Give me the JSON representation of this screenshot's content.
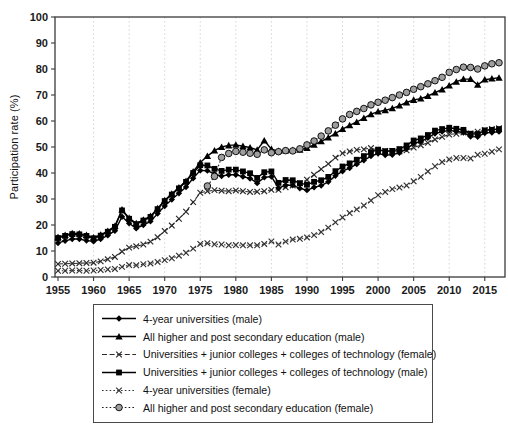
{
  "chart_data": {
    "type": "line",
    "title": "",
    "xlabel": "",
    "ylabel": "Participation rate (%)",
    "xlim": [
      1955,
      2018
    ],
    "ylim": [
      0,
      100
    ],
    "yticks": [
      0,
      10,
      20,
      30,
      40,
      50,
      60,
      70,
      80,
      90,
      100
    ],
    "xticks": [
      1955,
      1960,
      1965,
      1970,
      1975,
      1980,
      1985,
      1990,
      1995,
      2000,
      2005,
      2010,
      2015
    ],
    "grid": "vertical-dotted",
    "legend_position": "bottom-outside",
    "x": [
      1955,
      1956,
      1957,
      1958,
      1959,
      1960,
      1961,
      1962,
      1963,
      1964,
      1965,
      1966,
      1967,
      1968,
      1969,
      1970,
      1971,
      1972,
      1973,
      1974,
      1975,
      1976,
      1977,
      1978,
      1979,
      1980,
      1981,
      1982,
      1983,
      1984,
      1985,
      1986,
      1987,
      1988,
      1989,
      1990,
      1991,
      1992,
      1993,
      1994,
      1995,
      1996,
      1997,
      1998,
      1999,
      2000,
      2001,
      2002,
      2003,
      2004,
      2005,
      2006,
      2007,
      2008,
      2009,
      2010,
      2011,
      2012,
      2013,
      2014,
      2015,
      2016,
      2017
    ],
    "series": [
      {
        "name": "4-year universities (male)",
        "marker": "diamond",
        "line": "solid",
        "color": "#000000",
        "values": [
          13.1,
          13.9,
          14.6,
          14.6,
          14.0,
          13.7,
          14.6,
          16.0,
          17.8,
          23.2,
          20.7,
          18.7,
          20.0,
          21.4,
          24.4,
          27.3,
          29.8,
          32.2,
          34.6,
          38.0,
          41.0,
          40.9,
          39.6,
          38.8,
          39.3,
          39.3,
          38.6,
          37.9,
          36.1,
          38.3,
          38.6,
          34.2,
          35.3,
          35.3,
          34.1,
          33.4,
          34.5,
          35.2,
          36.6,
          38.9,
          40.7,
          41.9,
          43.4,
          44.9,
          46.5,
          47.5,
          46.9,
          47.0,
          47.8,
          49.3,
          51.3,
          52.1,
          53.5,
          55.2,
          55.9,
          56.4,
          56.0,
          55.6,
          54.0,
          53.9,
          55.4,
          55.6,
          55.9
        ]
      },
      {
        "name": "All higher and post secondary education (male)",
        "marker": "triangle",
        "line": "solid",
        "color": "#000000",
        "values": [
          15.3,
          16.1,
          16.8,
          16.7,
          16.1,
          15.2,
          16.2,
          17.7,
          19.6,
          25.9,
          22.7,
          20.6,
          22.0,
          23.4,
          26.4,
          29.5,
          32.0,
          34.4,
          36.9,
          40.5,
          44.0,
          46.5,
          48.6,
          50.0,
          50.6,
          50.8,
          50.3,
          49.8,
          48.9,
          52.5,
          49.2,
          48.4,
          48.6,
          48.8,
          48.9,
          49.6,
          50.8,
          52.2,
          53.6,
          55.2,
          56.9,
          58.3,
          59.6,
          61.1,
          62.6,
          63.6,
          64.1,
          64.9,
          65.9,
          67.1,
          68.1,
          68.6,
          69.6,
          70.9,
          72.1,
          73.6,
          75.1,
          76.1,
          76.1,
          73.9,
          75.9,
          76.3,
          76.6
        ]
      },
      {
        "name": "Universities + junior colleges + colleges of technology (female)",
        "marker": "x",
        "line": "dashed",
        "color": "#2a2a2a",
        "values": [
          5.0,
          5.1,
          5.2,
          5.3,
          5.4,
          5.5,
          6.0,
          6.8,
          7.7,
          9.8,
          11.3,
          11.8,
          12.5,
          13.6,
          15.3,
          17.7,
          19.8,
          22.4,
          25.1,
          28.8,
          32.4,
          33.0,
          33.4,
          33.2,
          33.0,
          33.3,
          33.0,
          32.7,
          32.8,
          33.0,
          33.5,
          33.5,
          34.5,
          35.2,
          36.0,
          37.4,
          39.3,
          41.5,
          43.5,
          45.9,
          47.6,
          48.3,
          48.9,
          49.1,
          49.6,
          48.7,
          48.5,
          48.5,
          48.3,
          48.7,
          49.8,
          50.7,
          51.6,
          52.9,
          53.9,
          54.8,
          55.1,
          55.6,
          55.2,
          55.9,
          56.5,
          56.9,
          57.2
        ]
      },
      {
        "name": "Universities + junior colleges + colleges of technology (male)",
        "marker": "square",
        "line": "solid",
        "color": "#000000",
        "values": [
          15.0,
          15.8,
          16.5,
          16.4,
          15.8,
          14.9,
          15.9,
          17.4,
          19.3,
          25.6,
          22.4,
          20.3,
          21.7,
          23.1,
          26.1,
          29.2,
          31.7,
          34.1,
          36.6,
          40.0,
          43.0,
          42.9,
          41.6,
          40.8,
          41.3,
          41.3,
          40.6,
          39.9,
          38.1,
          40.3,
          40.6,
          36.2,
          37.3,
          37.2,
          36.1,
          35.5,
          36.6,
          37.2,
          38.5,
          40.7,
          42.5,
          43.7,
          45.1,
          46.5,
          48.0,
          49.0,
          48.4,
          48.5,
          49.2,
          50.6,
          52.5,
          53.3,
          54.6,
          56.3,
          56.9,
          57.4,
          57.0,
          56.6,
          55.1,
          55.0,
          56.4,
          56.6,
          56.9
        ]
      },
      {
        "name": "4-year universities (female)",
        "marker": "x",
        "line": "dotted",
        "color": "#333333",
        "values": [
          2.4,
          2.4,
          2.5,
          2.5,
          2.4,
          2.5,
          2.7,
          2.9,
          3.1,
          3.9,
          4.6,
          4.5,
          4.9,
          5.2,
          5.8,
          6.5,
          7.2,
          8.2,
          9.3,
          10.9,
          12.7,
          13.0,
          12.6,
          12.5,
          12.2,
          12.3,
          12.2,
          12.2,
          12.2,
          12.7,
          13.7,
          12.5,
          13.6,
          14.4,
          14.7,
          15.2,
          16.1,
          17.3,
          19.0,
          21.0,
          22.9,
          24.6,
          26.0,
          27.5,
          29.4,
          31.5,
          32.7,
          33.8,
          34.4,
          35.2,
          36.8,
          38.5,
          40.6,
          42.6,
          44.2,
          45.2,
          45.8,
          45.8,
          45.6,
          47.0,
          47.4,
          48.2,
          49.1
        ]
      },
      {
        "name": "All higher and post secondary education (female)",
        "marker": "circle",
        "line": "dotted",
        "color": "#1a1a1a",
        "marker_fill": "#9e9e9e",
        "values": [
          null,
          null,
          null,
          null,
          null,
          null,
          null,
          null,
          null,
          null,
          null,
          null,
          null,
          null,
          null,
          null,
          null,
          null,
          null,
          null,
          null,
          35.0,
          38.7,
          46.0,
          47.5,
          48.3,
          48.0,
          47.6,
          47.2,
          48.9,
          47.8,
          48.2,
          48.6,
          48.5,
          49.3,
          50.8,
          52.3,
          54.2,
          56.2,
          58.4,
          60.8,
          62.5,
          63.7,
          64.8,
          66.2,
          67.2,
          68.0,
          69.0,
          70.0,
          71.0,
          72.2,
          73.2,
          74.3,
          75.5,
          76.8,
          78.7,
          79.8,
          80.7,
          80.6,
          80.0,
          81.2,
          82.0,
          82.4
        ]
      }
    ]
  },
  "colors": {
    "axis": "#3a3a3a",
    "gridline": "#c9c9c9",
    "tick_label": "#1a1a1a",
    "legend_border": "#4a4a4a",
    "background": "#ffffff",
    "circle_marker_fill": "#9e9e9e"
  }
}
